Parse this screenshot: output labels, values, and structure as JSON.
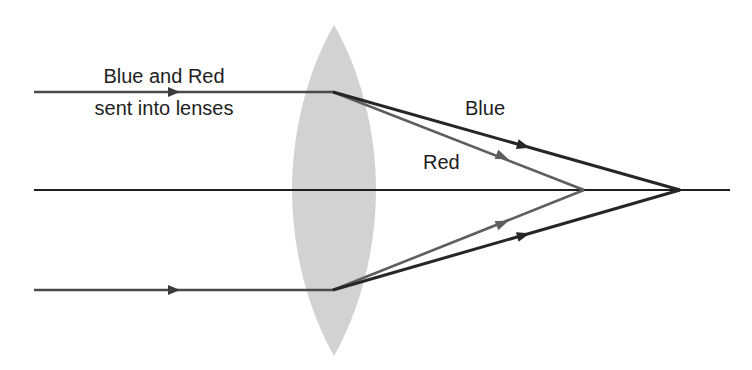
{
  "diagram": {
    "labels": {
      "incoming_line1": "Blue and Red",
      "incoming_line2": "sent into lenses",
      "blue": "Blue",
      "red": "Red"
    },
    "colors": {
      "background": "#ffffff",
      "lens_fill": "#d2d2d2",
      "axis": "#1e1e1e",
      "incoming_ray": "#4a4a4a",
      "blue_ray": "#262626",
      "red_ray": "#5e5e5e",
      "text": "#1e1e1e"
    },
    "geometry": {
      "axis": {
        "x1": 34,
        "x2": 730,
        "y": 190
      },
      "lens": {
        "cx": 334,
        "top_y": 25,
        "bottom_y": 356,
        "half_width": 42
      },
      "incoming_rays": [
        {
          "name": "top",
          "x1": 34,
          "x2": 333,
          "y": 92,
          "arrow_x": 174
        },
        {
          "name": "bottom",
          "x1": 34,
          "x2": 333,
          "y": 290,
          "arrow_x": 174
        }
      ],
      "blue_focus": {
        "x": 680,
        "y": 190
      },
      "red_focus": {
        "x": 584,
        "y": 190
      }
    }
  }
}
